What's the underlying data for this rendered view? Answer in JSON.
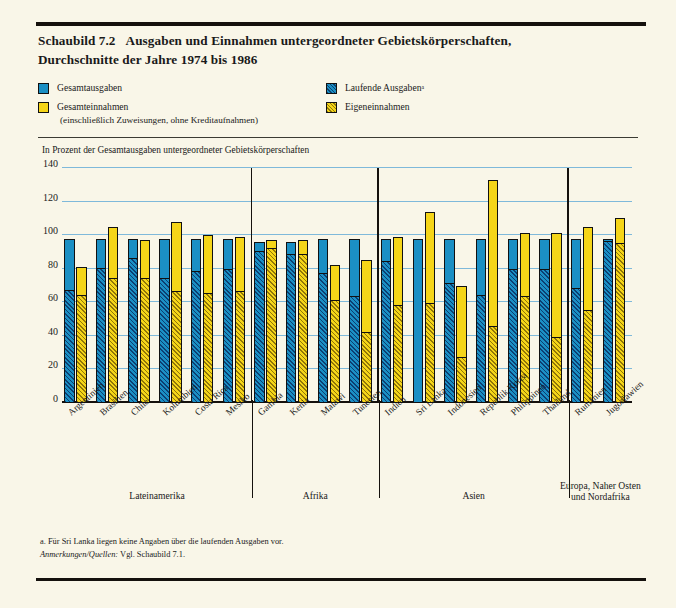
{
  "figure": {
    "number": "Schaubild 7.2",
    "title_line1": "Ausgaben und Einnahmen untergeordneter Gebietskörperschaften,",
    "title_line2": "Durchschnitte der Jahre 1974 bis 1986"
  },
  "legend": {
    "items": [
      {
        "label": "Gesamtausgaben",
        "swatch": "blue-solid-swatch",
        "color": "#1b8fc4"
      },
      {
        "label": "Gesamteinnahmen",
        "sub": "(einschließlich Zuweisungen, ohne Kreditaufnahmen)",
        "swatch": "yellow-solid-swatch",
        "color": "#f5d518"
      },
      {
        "label": "Laufende Ausgabenᵃ",
        "swatch": "blue-hatched-swatch",
        "color": "#1b8fc4"
      },
      {
        "label": "Eigeneinnahmen",
        "swatch": "yellow-hatched-swatch",
        "color": "#f5d518"
      }
    ]
  },
  "notes": {
    "footnote_a": "a. Für Sri Lanka liegen keine Angaben über die laufenden Ausgaben vor.",
    "source_label": "Anmerkungen/Quellen:",
    "source_text": " Vgl. Schaubild 7.1."
  },
  "chart_data": {
    "type": "bar",
    "title": "Ausgaben und Einnahmen untergeordneter Gebietskörperschaften, Durchschnitte der Jahre 1974 bis 1986",
    "ylabel": "In Prozent der Gesamtausgaben untergeordneter Gebietskörperschaften",
    "xlabel": "",
    "ylim": [
      0,
      140
    ],
    "yticks": [
      0,
      20,
      40,
      60,
      80,
      100,
      120,
      140
    ],
    "grid": true,
    "legend_position": "top",
    "categories": [
      "Argentinien",
      "Brasilien",
      "Chile",
      "Kolumbien",
      "Costa Rica",
      "Mesiko",
      "Gambia",
      "Kenia",
      "Malawi",
      "Tunesien",
      "Indien",
      "Sri Lanka",
      "Indonesien",
      "Republik Korea",
      "Philippinen",
      "Thailand",
      "Rumänien",
      "Jugoslawien"
    ],
    "series": [
      {
        "name": "Gesamtausgaben",
        "values": [
          98,
          98,
          98,
          98,
          98,
          98,
          96,
          96,
          98,
          98,
          98,
          98,
          98,
          98,
          98,
          98,
          98,
          98
        ]
      },
      {
        "name": "Laufende Ausgaben",
        "values": [
          67,
          80,
          86,
          74,
          78,
          79,
          90,
          88,
          77,
          63,
          84,
          null,
          71,
          64,
          79,
          79,
          68,
          96
        ]
      },
      {
        "name": "Gesamteinnahmen",
        "values": [
          81,
          105,
          97,
          108,
          100,
          99,
          97,
          97,
          82,
          85,
          99,
          114,
          70,
          133,
          101,
          101,
          105,
          110
        ]
      },
      {
        "name": "Eigeneinnahmen",
        "values": [
          64,
          74,
          74,
          66,
          65,
          66,
          92,
          88,
          61,
          42,
          58,
          59,
          27,
          45,
          63,
          39,
          55,
          95
        ]
      }
    ],
    "regions": [
      {
        "label": "Lateinamerika",
        "countries": [
          "Argentinien",
          "Brasilien",
          "Chile",
          "Kolumbien",
          "Costa Rica",
          "Mesiko"
        ]
      },
      {
        "label": "Afrika",
        "countries": [
          "Gambia",
          "Kenia",
          "Malawi",
          "Tunesien"
        ]
      },
      {
        "label": "Asien",
        "countries": [
          "Indien",
          "Sri Lanka",
          "Indonesien",
          "Republik Korea",
          "Philippinen",
          "Thailand"
        ]
      },
      {
        "label": "Europa, Naher Osten\nund Nordafrika",
        "label_line1": "Europa, Naher Osten",
        "label_line2": "und Nordafrika",
        "countries": [
          "Rumänien",
          "Jugoslawien"
        ]
      }
    ]
  }
}
